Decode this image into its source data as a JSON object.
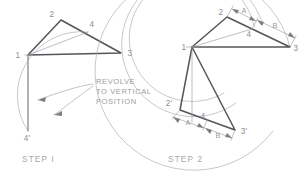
{
  "figure": {
    "title": "Revolve To Vertical Position",
    "colors": {
      "background": "#ffffff",
      "heavy_stroke": "#55555a",
      "medium_stroke": "#6d6d74",
      "light_stroke": "#9b9ba3",
      "arc_stroke": "#a3a3ab",
      "label_text": "#8d8d95",
      "note_text": "#9c9ca4",
      "caption_text": "#a6a6ae"
    }
  },
  "step1": {
    "caption": "STEP I",
    "note_lines": [
      "REVOLVE",
      "TO VERTICAL",
      "POSITION"
    ],
    "vertex_labels": {
      "v1": "1",
      "v2": "2",
      "v3": "3",
      "v4": "4",
      "v4prime": "4'"
    },
    "geometry": {
      "triangle_1_2_3": [
        [
          28,
          55
        ],
        [
          61,
          20
        ],
        [
          121,
          53
        ]
      ],
      "point_4_on_2_3": [
        88,
        32
      ],
      "line_1_to_4": [
        [
          28,
          55
        ],
        [
          88,
          32
        ]
      ],
      "vertical_drop": [
        [
          28,
          55
        ],
        [
          28,
          131
        ]
      ],
      "point_4prime": [
        28,
        131
      ],
      "arc_from_4_to_4prime": {
        "center": [
          28,
          55
        ],
        "radius": 64,
        "start": [
          88,
          32
        ],
        "end": [
          28,
          131
        ]
      }
    }
  },
  "step2": {
    "caption": "STEP 2",
    "vertex_labels": {
      "v1": "1",
      "v2": "2",
      "v3": "3",
      "v4": "4",
      "v2prime": "2'",
      "v3prime": "3'",
      "v4prime": "4"
    },
    "dimension_labels": {
      "upper_a": "A",
      "upper_b": "B",
      "lower_a": "A",
      "lower_b": "B"
    },
    "geometry": {
      "triangle_1_2_3": [
        [
          192,
          47
        ],
        [
          227,
          17
        ],
        [
          290,
          47
        ]
      ],
      "point_4_on_2_3": [
        252,
        29
      ],
      "line_1_to_4": [
        [
          192,
          47
        ],
        [
          252,
          29
        ]
      ],
      "rotated_triangle_1_2p_3p": [
        [
          192,
          47
        ],
        [
          180,
          110
        ],
        [
          235,
          130
        ]
      ],
      "point_4_rotated": [
        207,
        120
      ],
      "vertical_from_1": [
        [
          192,
          47
        ],
        [
          192,
          122
        ]
      ],
      "arcs": [
        {
          "center": [
            192,
            47
          ],
          "radius": 63,
          "from_angle": -59,
          "to_angle": 81
        },
        {
          "center": [
            192,
            47
          ],
          "radius": 72,
          "from_angle": -50,
          "to_angle": 75
        },
        {
          "center": [
            192,
            47
          ],
          "radius": 99,
          "from_angle": -27,
          "to_angle": 58
        }
      ]
    }
  }
}
